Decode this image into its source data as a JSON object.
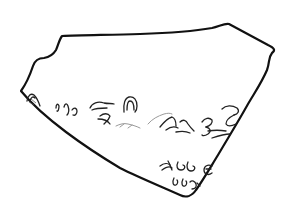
{
  "image": {
    "subject": "Line drawing of an inscribed ostracon (pottery sherd) fragment",
    "description": "Irregular sherd outline with ink inscription in three lines along the lower-left edge",
    "colors": {
      "background": "#ffffff",
      "outline": "#111111",
      "ink": "#222222",
      "faded_ink": "#9a9a9a"
    },
    "inscription": {
      "line_count": 3,
      "lines": [
        {
          "name": "line-1",
          "legibility": "partially faded in middle"
        },
        {
          "name": "line-2",
          "legibility": "legible"
        },
        {
          "name": "line-3",
          "legibility": "legible"
        }
      ]
    }
  }
}
